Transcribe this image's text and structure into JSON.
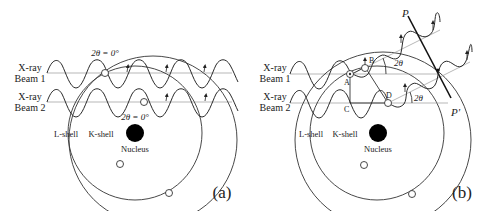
{
  "panels": [
    {
      "id": "a",
      "panel_label": "(a)",
      "beam1_label_line1": "X-ray",
      "beam1_label_line2": "Beam 1",
      "beam2_label_line1": "X-ray",
      "beam2_label_line2": "Beam 2",
      "angle_label_top": "2θ = 0°",
      "angle_label_mid": "2θ = 0°",
      "l_shell_label": "L-shell",
      "k_shell_label": "K-shell",
      "nucleus_label": "Nucleus"
    },
    {
      "id": "b",
      "panel_label": "(b)",
      "beam1_label_line1": "X-ray",
      "beam1_label_line2": "Beam 1",
      "beam2_label_line1": "X-ray",
      "beam2_label_line2": "Beam 2",
      "angle_label_1": "2θ",
      "angle_label_2": "2θ",
      "point_a": "A",
      "point_b": "B",
      "point_c": "C",
      "point_d": "D",
      "wavefront_top": "P",
      "wavefront_bottom": "P'",
      "l_shell_label": "L-shell",
      "k_shell_label": "K-shell",
      "nucleus_label": "Nucleus"
    }
  ]
}
